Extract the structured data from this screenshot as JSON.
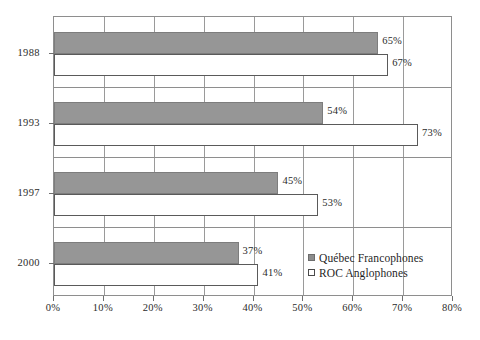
{
  "chart_data": {
    "type": "bar",
    "orientation": "horizontal",
    "title": "",
    "subtitle": "",
    "xlabel": "",
    "ylabel": "",
    "categories": [
      "1988",
      "1993",
      "1997",
      "2000"
    ],
    "series": [
      {
        "name": "Québec Francophones",
        "color": "#969696",
        "values": [
          65,
          54,
          45,
          37
        ],
        "labels": [
          "65%",
          "54%",
          "45%",
          "37%"
        ]
      },
      {
        "name": "ROC Anglophones",
        "color": "#ffffff",
        "values": [
          67,
          73,
          53,
          41
        ],
        "labels": [
          "67%",
          "73%",
          "53%",
          "41%"
        ]
      }
    ],
    "xlim": [
      0,
      80
    ],
    "xticks": [
      0,
      10,
      20,
      30,
      40,
      50,
      60,
      70,
      80
    ],
    "xtick_labels": [
      "0%",
      "10%",
      "20%",
      "30%",
      "40%",
      "50%",
      "60%",
      "70%",
      "80%"
    ],
    "ytick_labels": [
      "1988",
      "1993",
      "1997",
      "2000"
    ],
    "grid": {
      "vertical": true,
      "horizontal": true
    },
    "legend": {
      "position": "inside-bottom-right",
      "entries": [
        {
          "label": "Québec Francophones",
          "swatch": "filled-gray-square"
        },
        {
          "label": "ROC Anglophones",
          "swatch": "open-white-square"
        }
      ]
    },
    "colors": {
      "series_0_fill": "#969696",
      "series_0_stroke": "#7d7d7d",
      "series_1_fill": "#ffffff",
      "series_1_stroke": "#5a5a5a",
      "grid": "#9a9a9a",
      "frame": "#8e8e8e",
      "text": "#2b2b2b",
      "background": "#ffffff"
    }
  }
}
